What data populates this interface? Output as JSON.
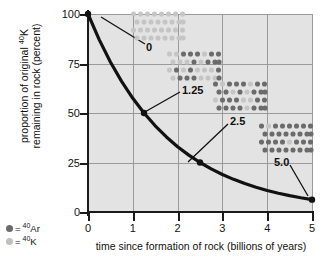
{
  "chart_data": {
    "type": "line",
    "title": "",
    "xlabel": "time since formation of rock (billions of years)",
    "ylabel_line1": "proportion of original 40K",
    "ylabel_line2": "remaining in rock (percent)",
    "xlim": [
      0,
      5
    ],
    "ylim": [
      0,
      100
    ],
    "xticks": [
      "0",
      "1",
      "2",
      "3",
      "4",
      "5"
    ],
    "yticks": [
      "0",
      "25",
      "50",
      "75",
      "100"
    ],
    "grid": true,
    "series": [
      {
        "name": "40K remaining",
        "x": [
          0,
          0.25,
          0.5,
          0.75,
          1.0,
          1.25,
          1.5,
          1.75,
          2.0,
          2.25,
          2.5,
          2.75,
          3.0,
          3.25,
          3.5,
          3.75,
          4.0,
          4.25,
          4.5,
          4.75,
          5.0
        ],
        "y": [
          100,
          87.06,
          75.79,
          65.98,
          57.43,
          50.0,
          43.53,
          37.89,
          32.99,
          28.72,
          25.0,
          21.76,
          18.95,
          16.49,
          14.36,
          12.5,
          10.88,
          9.47,
          8.25,
          7.18,
          6.25
        ]
      }
    ],
    "markers": [
      {
        "x": 0,
        "y": 100,
        "label": "0"
      },
      {
        "x": 1.25,
        "y": 50,
        "label": "1.25"
      },
      {
        "x": 2.5,
        "y": 25,
        "label": "2.5"
      },
      {
        "x": 5.0,
        "y": 6.25,
        "label": "5.0"
      }
    ],
    "half_life_billions_years": 1.25
  },
  "axes": {
    "y_title_line1_pre": "proportion of original ",
    "y_title_line1_sup": "40",
    "y_title_line1_post": "K",
    "y_title_line2": "remaining in rock (percent)",
    "x_title": "time since formation of rock (billions of years)",
    "yticks": [
      {
        "value": 100,
        "label": "100"
      },
      {
        "value": 75,
        "label": "75"
      },
      {
        "value": 50,
        "label": "50"
      },
      {
        "value": 25,
        "label": "25"
      },
      {
        "value": 0,
        "label": "0"
      }
    ],
    "xticks": [
      {
        "value": 0,
        "label": "0"
      },
      {
        "value": 1,
        "label": "1"
      },
      {
        "value": 2,
        "label": "2"
      },
      {
        "value": 3,
        "label": "3"
      },
      {
        "value": 4,
        "label": "4"
      },
      {
        "value": 5,
        "label": "5"
      }
    ]
  },
  "legend": {
    "items": [
      {
        "symbol": "dot",
        "color": "#6b6b6b",
        "equals": "=",
        "sup": "40",
        "element": "Ar",
        "name": "argon-40"
      },
      {
        "symbol": "dot",
        "color": "#c0c0c0",
        "equals": "=",
        "sup": "40",
        "element": "K",
        "name": "potassium-40"
      }
    ]
  },
  "atom_grids": [
    {
      "id": "grid-0",
      "caption": "0",
      "time_billions_years": 0,
      "total_atoms": 32,
      "dark_atoms": 0,
      "light_atoms": 32,
      "left": 130,
      "top": 10,
      "width": 56,
      "height": 32,
      "caption_left": 146,
      "caption_top": 42,
      "leader": {
        "x1": 101,
        "y1": 17,
        "x2": 145,
        "y2": 44
      }
    },
    {
      "id": "grid-1.25",
      "caption": "1.25",
      "time_billions_years": 1.25,
      "total_atoms": 32,
      "dark_atoms": 16,
      "light_atoms": 16,
      "left": 166,
      "top": 50,
      "width": 56,
      "height": 32,
      "caption_left": 182,
      "caption_top": 85,
      "leader": {
        "x1": 143,
        "y1": 113,
        "x2": 180,
        "y2": 92
      }
    },
    {
      "id": "grid-2.5",
      "caption": "2.5",
      "time_billions_years": 2.5,
      "total_atoms": 32,
      "dark_atoms": 24,
      "light_atoms": 8,
      "left": 212,
      "top": 80,
      "width": 56,
      "height": 32,
      "caption_left": 230,
      "caption_top": 116,
      "leader": {
        "x1": 188,
        "y1": 162,
        "x2": 228,
        "y2": 124
      }
    },
    {
      "id": "grid-5.0",
      "caption": "5.0",
      "time_billions_years": 5.0,
      "total_atoms": 32,
      "dark_atoms": 30,
      "light_atoms": 2,
      "left": 258,
      "top": 122,
      "width": 56,
      "height": 32,
      "caption_left": 274,
      "caption_top": 157,
      "leader": {
        "x1": 290,
        "y1": 165,
        "x2": 308,
        "y2": 196
      }
    }
  ],
  "colors": {
    "plot_background": "#e3e3e3",
    "page_background": "#ffffff",
    "gridline": "#9a9a9a",
    "axis": "#1a1a1a",
    "curve": "#111111",
    "marker": "#111111",
    "atom_dark": "#6b6b6b",
    "atom_light": "#c5c5c5"
  }
}
